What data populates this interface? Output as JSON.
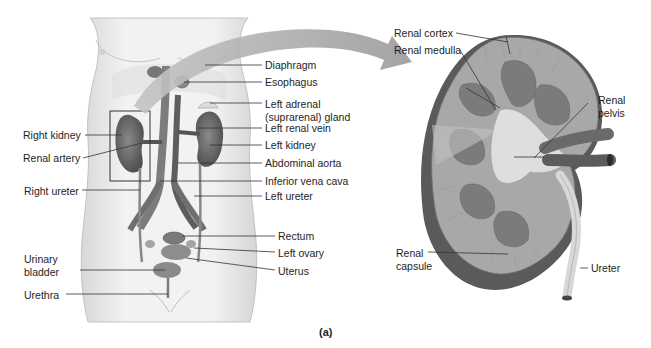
{
  "figure": {
    "caption": "(a)",
    "colors": {
      "organ": "#6e6e6e",
      "skin": "#ececec",
      "arrow": "#a9a9a9",
      "leader_line": "#333333"
    },
    "body_panel": {
      "left_labels": {
        "right_kidney": "Right kidney",
        "renal_artery": "Renal artery",
        "right_ureter": "Right ureter",
        "urinary_bladder_1": "Urinary",
        "urinary_bladder_2": "bladder",
        "urethra": "Urethra"
      },
      "right_labels": {
        "diaphragm": "Diaphragm",
        "esophagus": "Esophagus",
        "left_adrenal_1": "Left adrenal",
        "left_adrenal_2": "(suprarenal) gland",
        "left_renal_vein": "Left renal vein",
        "left_kidney": "Left kidney",
        "abdominal_aorta": "Abdominal aorta",
        "inferior_vena_cava": "Inferior vena cava",
        "left_ureter": "Left ureter",
        "rectum": "Rectum",
        "left_ovary": "Left ovary",
        "uterus": "Uterus"
      }
    },
    "kidney_panel": {
      "labels": {
        "renal_cortex": "Renal cortex",
        "renal_medulla": "Renal medulla",
        "renal_pelvis_1": "Renal",
        "renal_pelvis_2": "pelvis",
        "renal_capsule_1": "Renal",
        "renal_capsule_2": "capsule",
        "ureter": "Ureter"
      }
    }
  }
}
